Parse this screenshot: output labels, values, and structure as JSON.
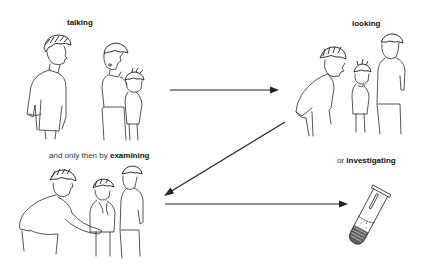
{
  "diagram": {
    "type": "process-flow-illustration",
    "steps": [
      {
        "id": "talking",
        "prefix": "",
        "emphasis": "talking",
        "figure": "doctor talking with mother and child"
      },
      {
        "id": "looking",
        "prefix": "",
        "emphasis": "looking",
        "figure": "doctor bending to look at child with parent"
      },
      {
        "id": "examining",
        "prefix": "and only then by ",
        "emphasis": "examining",
        "figure": "doctor examining child's abdomen with parent"
      },
      {
        "id": "investigating",
        "prefix": "or ",
        "emphasis": "investigating",
        "figure": "test tube with sample"
      }
    ],
    "arrows": [
      {
        "from": "talking",
        "to": "looking",
        "direction": "right"
      },
      {
        "from": "looking",
        "to": "examining",
        "direction": "down-left"
      },
      {
        "from": "examining",
        "to": "investigating",
        "direction": "right"
      }
    ],
    "colors": {
      "ink": "#222222",
      "background": "#ffffff"
    }
  }
}
